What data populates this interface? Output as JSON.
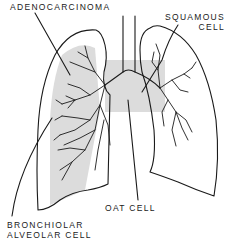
{
  "diagram": {
    "type": "anatomical-illustration",
    "labels": {
      "adenocarcinoma": "ADENOCARCINOMA",
      "squamous_line1": "SQUAMOUS",
      "squamous_line2": "CELL",
      "oat_cell": "OAT CELL",
      "bronchiolar_line1": "BRONCHIOLAR",
      "bronchiolar_line2": "ALVEOLAR CELL"
    },
    "colors": {
      "line": "#1a1a1a",
      "shade": "#dcdcdc",
      "background": "#ffffff"
    }
  }
}
